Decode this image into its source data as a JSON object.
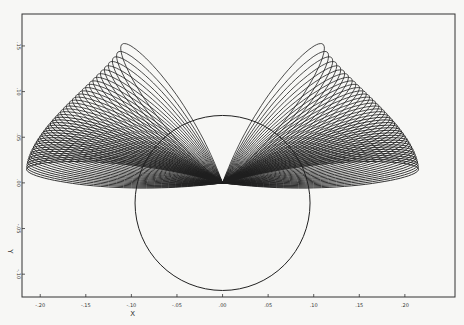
{
  "chart_data": {
    "type": "line",
    "title": "",
    "xlabel": "X",
    "ylabel": "Y",
    "xlim": [
      -0.22,
      0.255
    ],
    "ylim": [
      -0.125,
      0.185
    ],
    "xticks": [
      -0.2,
      -0.15,
      -0.1,
      -0.05,
      0.0,
      0.05,
      0.1,
      0.15,
      0.2
    ],
    "xtick_labels": [
      "-.20",
      "-.15",
      "-.10",
      "-.05",
      ".00",
      ".05",
      ".10",
      ".15",
      ".20"
    ],
    "yticks": [
      0.15,
      0.1,
      0.05,
      0.0,
      -0.05,
      -0.1
    ],
    "ytick_labels": [
      ".15",
      ".10",
      ".05",
      ".00",
      "-.05",
      "-.10"
    ],
    "grid": false,
    "legend": "none",
    "circle": {
      "center": [
        0.0,
        -0.022
      ],
      "radius": 0.096
    },
    "loop_family": {
      "description": "symmetric family of petal-shaped loops emanating from the origin cusp, fanning outward on left and right",
      "count_per_side": 40,
      "cusp": [
        0.0,
        0.0
      ],
      "innermost_tip": [
        0.11,
        0.152
      ],
      "outermost_tip": [
        0.215,
        0.015
      ],
      "petal_tips_sample": [
        [
          0.11,
          0.152
        ],
        [
          0.125,
          0.134
        ],
        [
          0.138,
          0.118
        ],
        [
          0.15,
          0.104
        ],
        [
          0.16,
          0.092
        ],
        [
          0.17,
          0.081
        ],
        [
          0.178,
          0.071
        ],
        [
          0.186,
          0.062
        ],
        [
          0.193,
          0.054
        ],
        [
          0.199,
          0.046
        ],
        [
          0.204,
          0.039
        ],
        [
          0.208,
          0.032
        ],
        [
          0.211,
          0.026
        ],
        [
          0.214,
          0.02
        ],
        [
          0.215,
          0.015
        ]
      ]
    }
  }
}
